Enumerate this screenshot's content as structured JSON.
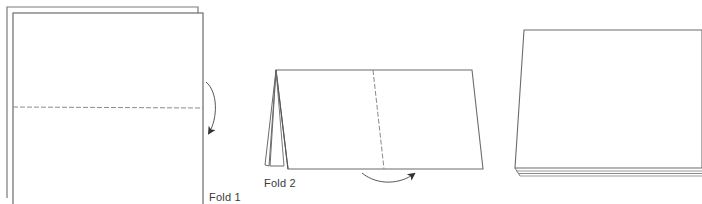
{
  "diagram": {
    "type": "paper-folding-instructions",
    "steps": [
      {
        "id": "fold1",
        "label": "Fold 1",
        "description": "Two stacked sheets with a horizontal dashed fold line across the middle; curved arrow on the right indicating folding the top half down."
      },
      {
        "id": "fold2",
        "label": "Fold 2",
        "description": "Folded sheet shown as a tent shape with a vertical dashed fold line in the middle; curved arrow under the bottom edge indicating folding left to right."
      },
      {
        "id": "result",
        "label": "",
        "description": "Resulting stacked folded sheets shown in perspective, layers visible along the bottom edge."
      }
    ],
    "colors": {
      "line": "#6b6b6b",
      "dashed": "#8a8a8a",
      "arrow": "#444444",
      "stack_edge": "#9a9a9a",
      "background": "#ffffff"
    }
  }
}
